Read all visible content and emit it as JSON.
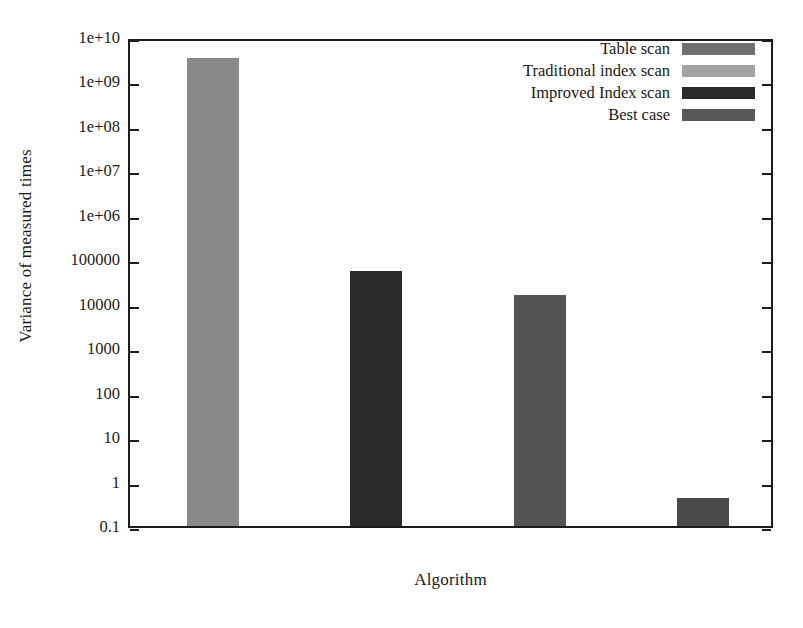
{
  "chart_data": {
    "type": "bar",
    "title": "",
    "xlabel": "Algorithm",
    "ylabel": "Variance of measured times",
    "yscale": "log",
    "ylim": [
      0.1,
      10000000000
    ],
    "grid": false,
    "legend_position": "top-right",
    "ytick_labels": [
      "1e+10",
      "1e+09",
      "1e+08",
      "1e+07",
      "1e+06",
      "100000",
      "10000",
      "1000",
      "100",
      "10",
      "1",
      "0.1"
    ],
    "ytick_values": [
      10000000000,
      1000000000,
      100000000,
      10000000,
      1000000,
      100000,
      10000,
      1000,
      100,
      10,
      1,
      0.1
    ],
    "xtick_labels": [],
    "categories": [
      "Table scan",
      "Traditional index scan",
      "Improved Index scan",
      "Best case"
    ],
    "values": [
      3400000000,
      55000,
      16000,
      0.42
    ],
    "series": [
      {
        "name": "Table scan",
        "value": 3400000000,
        "color": "#8a8a8a"
      },
      {
        "name": "Traditional index scan",
        "value": 55000,
        "color": "#2a2a2a"
      },
      {
        "name": "Improved Index scan",
        "value": 16000,
        "color": "#545454"
      },
      {
        "name": "Best case",
        "value": 0.42,
        "color": "#4a4a4a"
      }
    ]
  },
  "axes": {
    "y_title": "Variance of measured times",
    "x_title": "Algorithm",
    "ticks": [
      {
        "label": "1e+10"
      },
      {
        "label": "1e+09"
      },
      {
        "label": "1e+08"
      },
      {
        "label": "1e+07"
      },
      {
        "label": "1e+06"
      },
      {
        "label": "100000"
      },
      {
        "label": "10000"
      },
      {
        "label": "1000"
      },
      {
        "label": "100"
      },
      {
        "label": "10"
      },
      {
        "label": "1"
      },
      {
        "label": "0.1"
      }
    ]
  },
  "legend": {
    "entries": [
      {
        "label": "Table scan",
        "color": "#6f6f6f"
      },
      {
        "label": "Traditional index scan",
        "color": "#a3a3a3"
      },
      {
        "label": "Improved Index scan",
        "color": "#2a2a2a"
      },
      {
        "label": "Best case",
        "color": "#585858"
      }
    ]
  }
}
